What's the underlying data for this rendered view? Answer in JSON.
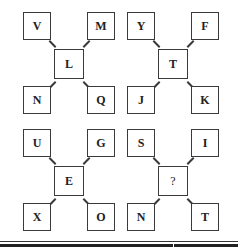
{
  "puzzle": {
    "figures": [
      {
        "top_left": "V",
        "top_right": "M",
        "center": "L",
        "bottom_left": "N",
        "bottom_right": "Q"
      },
      {
        "top_left": "Y",
        "top_right": "F",
        "center": "T",
        "bottom_left": "J",
        "bottom_right": "K"
      },
      {
        "top_left": "U",
        "top_right": "G",
        "center": "E",
        "bottom_left": "X",
        "bottom_right": "O"
      },
      {
        "top_left": "S",
        "top_right": "I",
        "center": "?",
        "bottom_left": "N",
        "bottom_right": "T"
      }
    ]
  }
}
